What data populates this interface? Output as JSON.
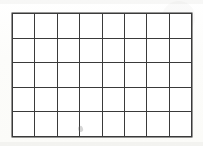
{
  "document": {
    "kind": "blank-grid-worksheet",
    "background_color": "#fdfdfb",
    "cell_fill_color": "#ffffff"
  },
  "grid": {
    "title": "",
    "columns": 8,
    "rows": 5,
    "line_color": "#3a3a3a",
    "line_width_px": 2,
    "origin_x_px": 12,
    "origin_y_px": 13,
    "width_px": 180,
    "height_px": 124,
    "cell_width_px": 22.5,
    "cell_height_px": 24.8,
    "vertical_line_x_px": [
      12,
      35,
      58,
      80,
      103,
      125,
      148,
      170,
      192
    ],
    "horizontal_line_y_px": [
      13,
      38,
      63,
      88,
      112,
      137
    ],
    "cells": [
      [
        "",
        "",
        "",
        "",
        "",
        "",
        "",
        ""
      ],
      [
        "",
        "",
        "",
        "",
        "",
        "",
        "",
        ""
      ],
      [
        "",
        "",
        "",
        "",
        "",
        "",
        "",
        ""
      ],
      [
        "",
        "",
        "",
        "",
        "",
        "",
        "",
        ""
      ],
      [
        "",
        "",
        "",
        "",
        "",
        "",
        "",
        ""
      ]
    ]
  },
  "artifacts": {
    "smudge": {
      "label": "scan-smudge",
      "x_px": 78,
      "y_px": 126
    }
  }
}
